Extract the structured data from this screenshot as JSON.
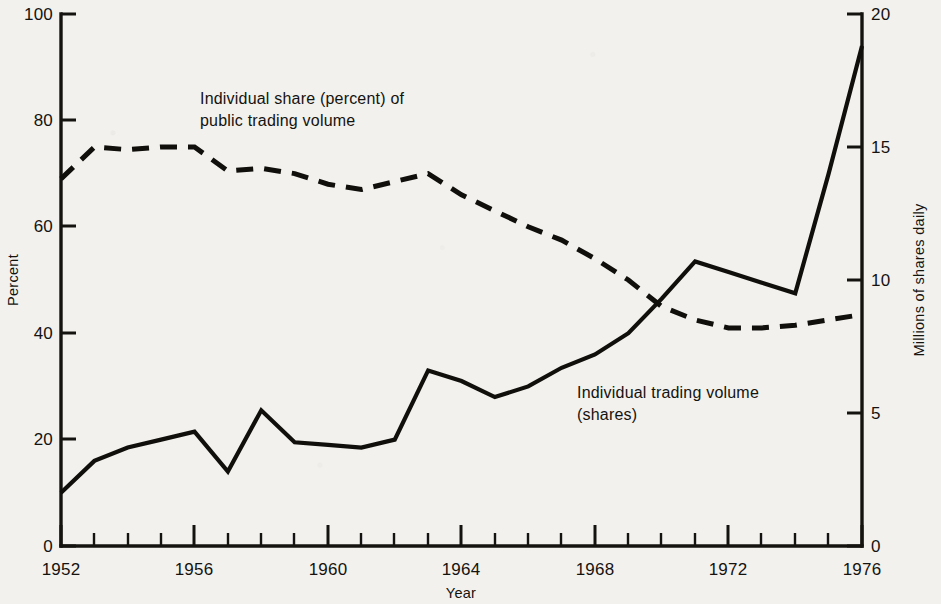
{
  "chart_data": {
    "type": "line",
    "title": "",
    "xlabel": "Year",
    "ylabel": "Percent",
    "y2label": "Millions of shares daily",
    "xlim": [
      1952,
      1976
    ],
    "ylim": [
      0,
      100
    ],
    "y2lim": [
      0,
      20
    ],
    "grid": false,
    "legend_position": "inline-annotations",
    "xticks": [
      1952,
      1956,
      1960,
      1964,
      1968,
      1972,
      1976
    ],
    "xticklabels": [
      "1952",
      "1956",
      "1960",
      "1964",
      "1968",
      "1972",
      "1976"
    ],
    "xminor_step": 1,
    "yticks": [
      0,
      20,
      40,
      60,
      80,
      100
    ],
    "yticklabels": [
      "0",
      "20",
      "40",
      "60",
      "80",
      "100"
    ],
    "y2ticks": [
      0,
      5,
      10,
      15,
      20
    ],
    "y2ticklabels": [
      "0",
      "5",
      "10",
      "15",
      "20"
    ],
    "x": [
      1952,
      1953,
      1954,
      1955,
      1956,
      1957,
      1958,
      1959,
      1960,
      1961,
      1962,
      1963,
      1964,
      1965,
      1966,
      1967,
      1968,
      1969,
      1970,
      1971,
      1972,
      1973,
      1974,
      1975,
      1976
    ],
    "series": [
      {
        "name": "Individual share (percent) of public trading volume",
        "axis": "left",
        "style": "dashed",
        "unit": "percent",
        "values": [
          69,
          75,
          74.5,
          75,
          75,
          70.5,
          71,
          70,
          68,
          67,
          68.5,
          70,
          66,
          63,
          60,
          57.5,
          54,
          50,
          45,
          42.5,
          41,
          41,
          41.5,
          42.5,
          43.5
        ]
      },
      {
        "name": "Individual trading volume (shares)",
        "axis": "right",
        "style": "solid",
        "unit": "millions of shares daily",
        "values_percent_scale": [
          10,
          16,
          18.5,
          20,
          21.5,
          14,
          25.5,
          19.5,
          19,
          18.5,
          20,
          33,
          31,
          28,
          30,
          33.5,
          36,
          40,
          46.5,
          53.5,
          51.5,
          49.5,
          47.5,
          70,
          94
        ],
        "values": [
          2.0,
          3.2,
          3.7,
          4.0,
          4.3,
          2.8,
          5.1,
          3.9,
          3.8,
          3.7,
          4.0,
          6.6,
          6.2,
          5.6,
          6.0,
          6.7,
          7.2,
          8.0,
          9.3,
          10.7,
          10.3,
          9.9,
          9.5,
          14.0,
          18.8
        ]
      }
    ],
    "annotations": [
      {
        "id": "annotation-individual-share",
        "line1": "Individual share (percent) of",
        "line2": "public trading volume"
      },
      {
        "id": "annotation-individual-volume",
        "line1": "Individual trading volume",
        "line2": "(shares)"
      }
    ],
    "colors": {
      "ink": "#15130f",
      "paper": "#f2f1ee"
    }
  }
}
